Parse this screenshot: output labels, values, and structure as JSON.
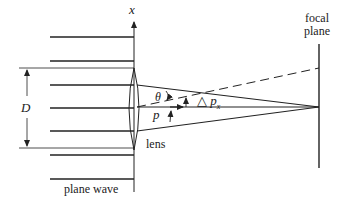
{
  "diagram": {
    "labels": {
      "x_axis": "x",
      "focal_plane_line1": "focal",
      "focal_plane_line2": "plane",
      "aperture": "D",
      "angle": "θ",
      "momentum": "p",
      "delta_p": "△ p",
      "delta_p_sub": "x",
      "lens": "lens",
      "plane_wave": "plane wave"
    },
    "colors": {
      "ink": "#222222",
      "background": "#ffffff"
    }
  }
}
